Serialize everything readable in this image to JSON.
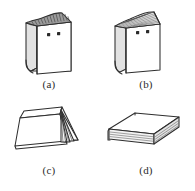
{
  "figure": {
    "background_color": "#ffffff",
    "line_color": "#2e2e2e",
    "label_color": "#2b2b2b",
    "panels": [
      {
        "id": "a",
        "label": "(a)",
        "description": "Book standing upright, closed, viewed from front-left; dark hatched page edges visible along the top; two small dark square marks on the front cover",
        "orientation": "upright-closed",
        "top_shading": "dark-hatched",
        "cover_marks": 2
      },
      {
        "id": "b",
        "label": "(b)",
        "description": "Book standing upright with pages fanned open at the top forming a peak; two small dark square marks on the front cover",
        "orientation": "upright-fanned-open",
        "top_shading": "fanned-pages",
        "cover_marks": 2
      },
      {
        "id": "c",
        "label": "(c)",
        "description": "Book standing open and inverted like a tent, resting on its open pages; page leaves fan out at the right end",
        "orientation": "tented-open-face-down",
        "top_shading": "none",
        "cover_marks": 0
      },
      {
        "id": "d",
        "label": "(d)",
        "description": "Book lying flat and closed on a surface, viewed in three-quarter perspective; stacked page edges visible on the near side",
        "orientation": "lying-flat-closed",
        "top_shading": "none",
        "cover_marks": 0
      }
    ]
  }
}
